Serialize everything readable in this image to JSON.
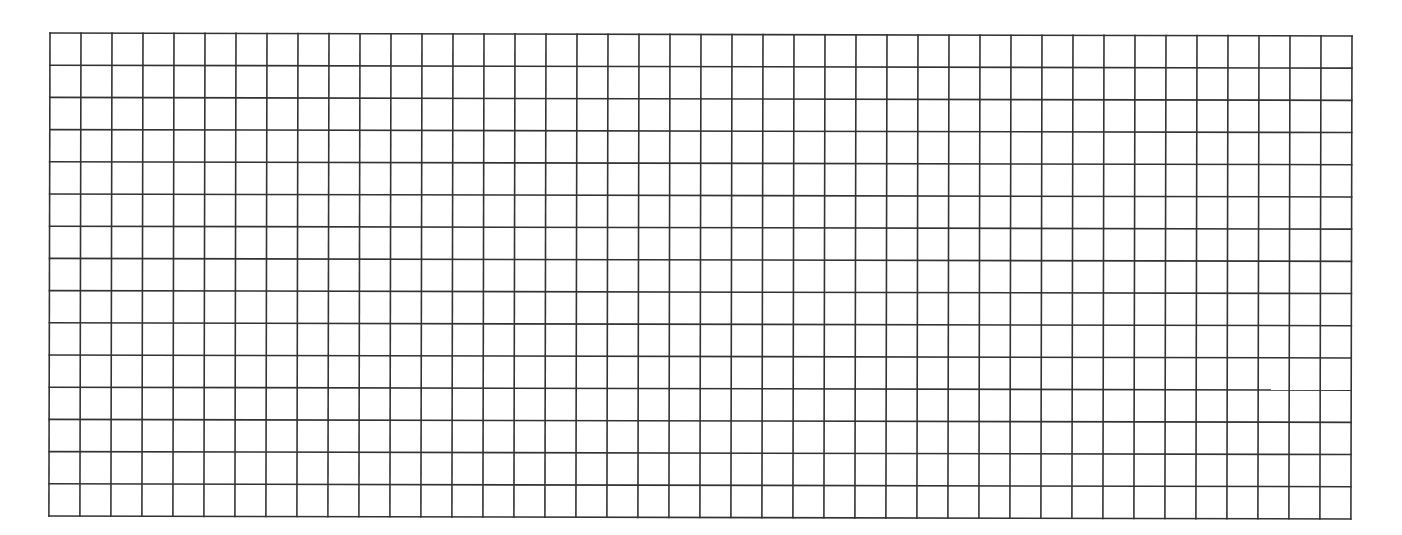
{
  "grid": {
    "columns": 42,
    "rows": 15,
    "line_color": "#333333",
    "background_color": "#ffffff",
    "line_width": 1.6
  }
}
